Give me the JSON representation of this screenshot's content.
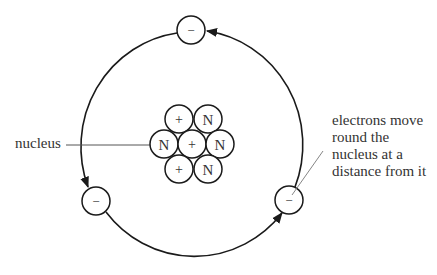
{
  "diagram": {
    "title_fragment": "",
    "colors": {
      "stroke": "#1a1a1a",
      "text": "#333333",
      "leader": "#666666",
      "background": "#ffffff"
    },
    "orbit": {
      "cx": 191,
      "cy": 144,
      "rx": 112,
      "ry": 115
    },
    "nucleus": {
      "label": "nucleus",
      "particles": [
        {
          "type": "proton",
          "symbol": "+",
          "cx": 179,
          "cy": 119
        },
        {
          "type": "neutron",
          "symbol": "N",
          "cx": 208,
          "cy": 119
        },
        {
          "type": "neutron",
          "symbol": "N",
          "cx": 164,
          "cy": 144
        },
        {
          "type": "proton",
          "symbol": "+",
          "cx": 192,
          "cy": 144
        },
        {
          "type": "neutron",
          "symbol": "N",
          "cx": 220,
          "cy": 144
        },
        {
          "type": "proton",
          "symbol": "+",
          "cx": 179,
          "cy": 169
        },
        {
          "type": "neutron",
          "symbol": "N",
          "cx": 208,
          "cy": 169
        }
      ],
      "particle_radius": 14
    },
    "electrons": [
      {
        "symbol": "−",
        "cx": 191,
        "cy": 30
      },
      {
        "symbol": "−",
        "cx": 96,
        "cy": 201
      },
      {
        "symbol": "−",
        "cx": 289,
        "cy": 200
      }
    ],
    "electron_radius": 14,
    "annotations": {
      "nucleus_label": "nucleus",
      "electron_label_lines": [
        "electrons move",
        "round the",
        "nucleus at a",
        "distance from it"
      ]
    }
  }
}
